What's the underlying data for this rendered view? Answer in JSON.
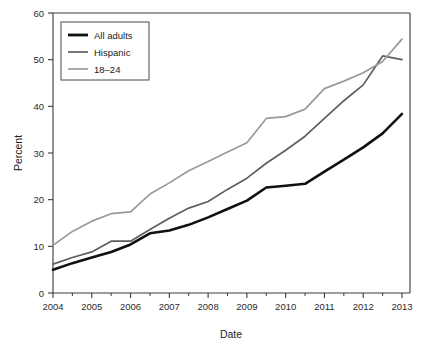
{
  "chart_data": {
    "type": "line",
    "title": "",
    "xlabel": "Date",
    "ylabel": "Percent",
    "xlim": [
      2004,
      2013
    ],
    "ylim": [
      0,
      60
    ],
    "xticks": [
      "2004",
      "2005",
      "2006",
      "2007",
      "2008",
      "2009",
      "2010",
      "2011",
      "2012",
      "2013"
    ],
    "yticks": [
      "0",
      "10",
      "20",
      "30",
      "40",
      "50",
      "60"
    ],
    "grid": false,
    "legend_position": "top-left inside plot",
    "x": [
      2004,
      2004.5,
      2005,
      2005.5,
      2006,
      2006.5,
      2007,
      2007.5,
      2008,
      2008.5,
      2009,
      2009.5,
      2010,
      2010.5,
      2011,
      2011.5,
      2012,
      2012.5,
      2013
    ],
    "series": [
      {
        "name": "All adults",
        "color": "#101010",
        "width": 2.6,
        "values": [
          5.0,
          6.4,
          7.6,
          8.8,
          10.4,
          12.8,
          13.4,
          14.6,
          16.2,
          18.0,
          19.8,
          22.4,
          23.0,
          23.2,
          25.4,
          27.6,
          29.8,
          31.8,
          33.8
        ]
      },
      {
        "name": "Hispanic",
        "color": "#5e5e5e",
        "width": 1.7,
        "values": [
          6.2,
          7.6,
          8.8,
          11.1,
          11.1,
          13.4,
          15.6,
          17.8,
          19.0,
          21.4,
          23.6,
          26.4,
          29.0,
          31.6,
          34.6,
          38.2,
          41.4,
          44.6,
          47.8
        ]
      },
      {
        "name": "18–24",
        "color": "#9a9a9a",
        "width": 1.7,
        "values": [
          10.2,
          13.0,
          15.0,
          16.6,
          17.2,
          20.4,
          22.6,
          24.6,
          26.6,
          28.2,
          30.2,
          31.6,
          32.8,
          34.8,
          37.6,
          37.8,
          38.6,
          41.6,
          43.2
        ]
      }
    ],
    "series_extended": {
      "note": "Values continue to chart right edge beyond 2013 tick label position",
      "x_full": [
        2004,
        2004.5,
        2005,
        2005.5,
        2006,
        2006.5,
        2007,
        2007.5,
        2008,
        2008.5,
        2009,
        2009.5,
        2010,
        2010.5,
        2011,
        2011.5,
        2012,
        2012.5,
        2013
      ],
      "all_adults_full": [
        5.0,
        6.4,
        7.6,
        8.8,
        10.4,
        12.8,
        13.4,
        14.6,
        16.2,
        18.0,
        19.8,
        22.6,
        23.0,
        23.4,
        26.0,
        28.6,
        31.2,
        34.2,
        38.4
      ],
      "hispanic_full": [
        6.2,
        7.6,
        8.8,
        11.1,
        11.1,
        13.6,
        16.0,
        18.2,
        19.6,
        22.2,
        24.6,
        27.8,
        30.6,
        33.6,
        37.4,
        41.2,
        44.6,
        50.8,
        50.0
      ],
      "age_18_24_full": [
        10.2,
        13.2,
        15.4,
        17.0,
        17.4,
        21.2,
        23.6,
        26.2,
        28.2,
        30.2,
        32.2,
        37.4,
        37.8,
        39.4,
        43.8,
        45.4,
        47.2,
        49.6,
        54.4
      ]
    }
  },
  "axes": {
    "y_title": "Percent",
    "x_title": "Date"
  },
  "legend": {
    "entries": [
      {
        "label": "All adults",
        "color": "#101010",
        "width": 2.8
      },
      {
        "label": "Hispanic",
        "color": "#5e5e5e",
        "width": 1.7
      },
      {
        "label": "18–24",
        "color": "#9a9a9a",
        "width": 1.7
      }
    ]
  },
  "colors": {
    "background": "#ffffff",
    "axis": "#3a3a3a",
    "text": "#1a1a1a",
    "all_adults": "#101010",
    "hispanic": "#5e5e5e",
    "age_18_24": "#9a9a9a"
  }
}
